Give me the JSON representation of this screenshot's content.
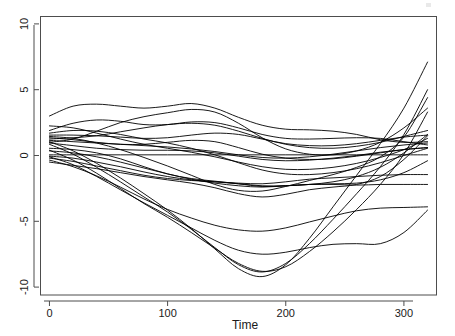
{
  "chart_data": {
    "type": "line",
    "title": "",
    "subtitle": "",
    "xlabel": "Time",
    "ylabel": "",
    "xlim": [
      -8,
      328
    ],
    "ylim": [
      -10.6,
      10.6
    ],
    "xticks": [
      0,
      100,
      200,
      300
    ],
    "xticklabels": [
      "0",
      "100",
      "200",
      "300"
    ],
    "yticks": [
      -10,
      -5,
      0,
      5,
      10
    ],
    "yticklabels": [
      "-10",
      "-5",
      "0",
      "5",
      "10"
    ],
    "grid": false,
    "legend": null,
    "legend_position": "none",
    "frame": "box",
    "line_color": "#000000",
    "background_color": "#ffffff",
    "axis_color": "#4d4d4d",
    "y_tick_label_rotation": -90,
    "n_series": 22,
    "x": [
      0,
      20,
      40,
      60,
      80,
      100,
      120,
      140,
      160,
      180,
      200,
      220,
      240,
      260,
      280,
      300,
      320
    ],
    "series": [
      {
        "name": "curve-01",
        "values": [
          3.0,
          3.75,
          3.9,
          3.75,
          3.6,
          3.75,
          3.95,
          3.6,
          2.9,
          2.3,
          2.0,
          1.95,
          1.85,
          1.6,
          1.2,
          1.0,
          1.05
        ]
      },
      {
        "name": "curve-02",
        "values": [
          1.9,
          2.45,
          2.7,
          2.6,
          2.35,
          2.35,
          2.55,
          2.5,
          2.1,
          1.6,
          1.3,
          1.25,
          1.3,
          1.35,
          1.3,
          1.05,
          0.8
        ]
      },
      {
        "name": "curve-03",
        "values": [
          1.55,
          1.55,
          1.5,
          1.4,
          1.3,
          1.35,
          1.55,
          1.7,
          1.6,
          1.25,
          0.9,
          0.75,
          0.75,
          0.9,
          1.15,
          1.4,
          1.55
        ]
      },
      {
        "name": "curve-04",
        "values": [
          1.35,
          1.2,
          1.0,
          0.85,
          0.85,
          1.0,
          1.15,
          1.05,
          0.6,
          0.1,
          -0.2,
          -0.3,
          -0.25,
          -0.05,
          0.2,
          0.45,
          0.6
        ]
      },
      {
        "name": "curve-05",
        "values": [
          1.15,
          1.05,
          0.95,
          0.85,
          0.75,
          0.65,
          0.5,
          0.3,
          0.05,
          -0.15,
          -0.2,
          -0.1,
          0.1,
          0.35,
          0.6,
          0.8,
          0.95
        ]
      },
      {
        "name": "curve-06",
        "values": [
          0.95,
          0.75,
          0.55,
          0.45,
          0.4,
          0.4,
          0.35,
          0.2,
          -0.05,
          -0.3,
          -0.4,
          -0.35,
          -0.2,
          0.0,
          0.25,
          0.45,
          0.6
        ]
      },
      {
        "name": "curve-07",
        "values": [
          0.05,
          0.05,
          0.05,
          0.05,
          0.05,
          0.05,
          0.05,
          0.05,
          0.05,
          0.05,
          0.05,
          0.05,
          0.05,
          0.05,
          0.05,
          0.05,
          0.05
        ]
      },
      {
        "name": "curve-08",
        "values": [
          1.7,
          1.9,
          1.85,
          1.6,
          1.25,
          0.95,
          0.55,
          0.05,
          -0.55,
          -1.1,
          -1.4,
          -1.45,
          -1.3,
          -1.0,
          -0.55,
          0.0,
          0.55
        ]
      },
      {
        "name": "curve-09",
        "values": [
          2.25,
          2.1,
          1.7,
          1.25,
          0.85,
          0.55,
          0.25,
          -0.1,
          -0.5,
          -0.85,
          -1.05,
          -1.05,
          -0.9,
          -0.6,
          -0.15,
          0.45,
          1.3
        ]
      },
      {
        "name": "curve-10",
        "values": [
          1.25,
          1.35,
          1.5,
          1.8,
          2.1,
          2.35,
          2.45,
          2.3,
          1.85,
          1.3,
          0.85,
          0.6,
          0.55,
          0.7,
          1.0,
          1.45,
          1.9
        ]
      },
      {
        "name": "curve-11",
        "values": [
          1.0,
          1.25,
          1.85,
          2.5,
          2.95,
          3.25,
          3.5,
          3.3,
          2.45,
          1.35,
          0.5,
          0.1,
          0.05,
          0.35,
          1.0,
          2.1,
          3.6
        ]
      },
      {
        "name": "curve-12",
        "values": [
          0.55,
          0.45,
          0.2,
          -0.25,
          -0.85,
          -1.4,
          -1.75,
          -1.95,
          -2.15,
          -2.35,
          -2.3,
          -2.2,
          -2.15,
          -2.1,
          -1.85,
          -1.3,
          -0.4
        ]
      },
      {
        "name": "curve-13",
        "values": [
          0.35,
          0.2,
          -0.1,
          -0.5,
          -0.95,
          -1.4,
          -1.8,
          -2.1,
          -2.3,
          -2.4,
          -2.3,
          -2.2,
          -2.2,
          -2.25,
          -2.2,
          -2.2,
          -2.2
        ]
      },
      {
        "name": "curve-14",
        "values": [
          -0.05,
          -0.2,
          -0.5,
          -0.85,
          -1.25,
          -1.6,
          -1.85,
          -2.0,
          -2.1,
          -2.15,
          -2.0,
          -1.8,
          -1.7,
          -1.6,
          -1.5,
          -1.45,
          -1.45
        ]
      },
      {
        "name": "curve-15",
        "values": [
          -0.2,
          -0.45,
          -0.8,
          -1.15,
          -1.5,
          -1.75,
          -1.9,
          -2.0,
          -2.15,
          -2.3,
          -2.3,
          -2.2,
          -2.0,
          -1.6,
          -0.9,
          0.2,
          1.6
        ]
      },
      {
        "name": "curve-16",
        "values": [
          -0.5,
          -0.75,
          -1.0,
          -1.3,
          -1.6,
          -1.85,
          -2.1,
          -2.45,
          -2.9,
          -3.15,
          -2.95,
          -2.6,
          -2.4,
          -2.2,
          -1.6,
          -0.3,
          1.5
        ]
      },
      {
        "name": "curve-17",
        "values": [
          -0.35,
          -0.85,
          -1.55,
          -2.4,
          -3.3,
          -4.1,
          -4.75,
          -5.3,
          -5.65,
          -5.75,
          -5.5,
          -5.05,
          -4.6,
          -4.2,
          -4.0,
          -3.95,
          -3.9
        ]
      },
      {
        "name": "curve-18",
        "values": [
          -0.1,
          -0.7,
          -1.6,
          -2.6,
          -3.6,
          -4.55,
          -5.5,
          -6.45,
          -7.2,
          -7.5,
          -7.35,
          -7.0,
          -6.75,
          -6.7,
          -6.7,
          -5.85,
          -4.15
        ]
      },
      {
        "name": "curve-19",
        "values": [
          0.4,
          -0.35,
          -1.35,
          -2.5,
          -3.65,
          -4.7,
          -5.85,
          -7.05,
          -8.2,
          -8.8,
          -8.45,
          -7.3,
          -5.8,
          -4.1,
          -2.2,
          0.1,
          3.3
        ]
      },
      {
        "name": "curve-20",
        "values": [
          0.85,
          0.1,
          -0.9,
          -2.0,
          -3.15,
          -4.3,
          -5.6,
          -7.0,
          -8.3,
          -8.85,
          -8.2,
          -6.7,
          -4.85,
          -2.9,
          -0.85,
          1.6,
          5.0
        ]
      },
      {
        "name": "curve-21",
        "values": [
          1.05,
          0.35,
          -0.6,
          -1.7,
          -2.9,
          -4.15,
          -5.55,
          -7.1,
          -8.6,
          -9.2,
          -8.3,
          -6.3,
          -3.9,
          -1.5,
          0.9,
          3.6,
          7.1
        ]
      },
      {
        "name": "curve-22",
        "values": [
          1.45,
          1.3,
          0.95,
          0.45,
          -0.15,
          -0.8,
          -1.5,
          -2.2,
          -2.65,
          -2.7,
          -2.35,
          -1.9,
          -1.45,
          -0.9,
          -0.1,
          1.4,
          4.4
        ]
      }
    ],
    "annotations": {
      "notes": "Spaghetti plot of smoothed trajectories; several series terminate early producing flat horizontal segments near y = 0, -1.45 and -2.2."
    }
  },
  "figure": {
    "plot_area": {
      "left": 40,
      "top": 16,
      "right": 437,
      "bottom": 295
    }
  }
}
